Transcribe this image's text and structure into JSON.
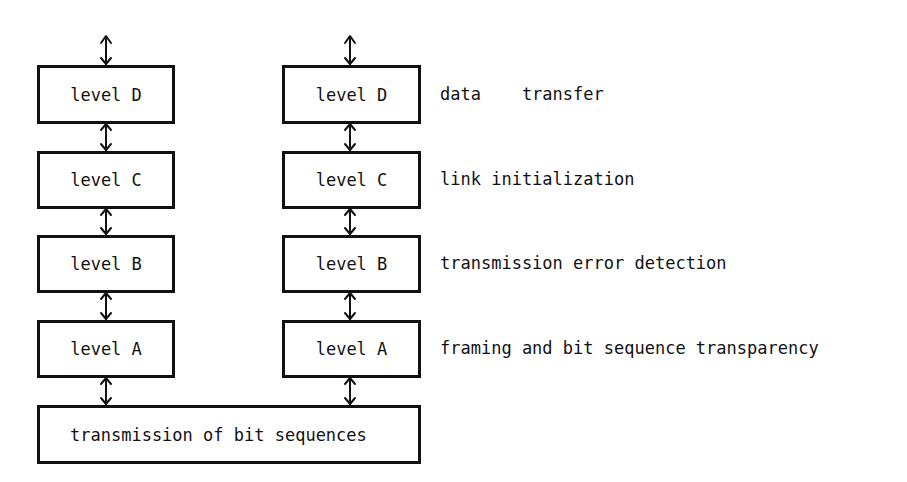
{
  "diagram": {
    "left_stack": [
      {
        "id": "left-level-d",
        "label": "level D"
      },
      {
        "id": "left-level-c",
        "label": "level C"
      },
      {
        "id": "left-level-b",
        "label": "level B"
      },
      {
        "id": "left-level-a",
        "label": "level A"
      }
    ],
    "right_stack": [
      {
        "id": "right-level-d",
        "label": "level D"
      },
      {
        "id": "right-level-c",
        "label": "level C"
      },
      {
        "id": "right-level-b",
        "label": "level B"
      },
      {
        "id": "right-level-a",
        "label": "level A"
      }
    ],
    "descriptions": [
      "data    transfer",
      "link initialization",
      "transmission error detection",
      "framing and bit sequence transparency"
    ],
    "base": {
      "label": "transmission of bit sequences"
    },
    "arrows": "bidirectional",
    "line_color": "#111111"
  }
}
